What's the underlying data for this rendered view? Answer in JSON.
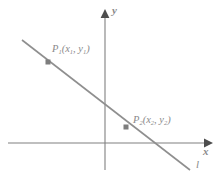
{
  "figure": {
    "type": "coordinate-plane-diagram",
    "background_color": "#ffffff",
    "axis_color": "#808080",
    "line_color": "#8a8a8a",
    "point_color": "#8a8a8a",
    "text_color": "#8a8a8a"
  },
  "axes": {
    "x_axis_label": "x",
    "y_axis_label": "y",
    "x_axis": {
      "from_x": 8,
      "to_x": 212,
      "y": 143,
      "arrow": "right"
    },
    "y_axis": {
      "x": 105,
      "from_y": 170,
      "to_y": 10,
      "arrow": "up"
    },
    "origin": {
      "x": 105,
      "y": 143
    }
  },
  "line": {
    "label": "l",
    "start": {
      "x": 22,
      "y": 40
    },
    "end": {
      "x": 190,
      "y": 170
    },
    "slope_sign": "negative"
  },
  "points": [
    {
      "id": "P1",
      "label_base": "P",
      "label_sub": "1",
      "label_full": "P₁(x₁, y₁)",
      "coord_x_base": "x",
      "coord_x_sub": "1",
      "coord_y_base": "y",
      "coord_y_sub": "1",
      "marker": {
        "x": 48,
        "y": 62
      }
    },
    {
      "id": "P2",
      "label_base": "P",
      "label_sub": "2",
      "label_full": "P₂(x₂, y₂)",
      "coord_x_base": "x",
      "coord_x_sub": "2",
      "coord_y_base": "y",
      "coord_y_sub": "2",
      "marker": {
        "x": 126,
        "y": 127
      }
    }
  ],
  "punctuation": {
    "open_paren": "(",
    "close_paren": ")",
    "comma": ", "
  }
}
